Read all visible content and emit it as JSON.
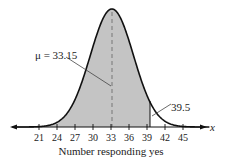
{
  "chart_data": {
    "type": "area",
    "title": "",
    "xlabel": "Number responding yes",
    "ylabel": "",
    "axis_variable": "x",
    "xticks": [
      21,
      24,
      27,
      30,
      33,
      36,
      39,
      42,
      45
    ],
    "xlim": [
      17,
      49
    ],
    "distribution": "normal",
    "mean": 33.15,
    "std_dev_est": 3.6,
    "shaded_region": {
      "from": -999,
      "to": 39.5,
      "color": "#c4c4c4"
    },
    "annotations": [
      {
        "text": "μ = 33.15",
        "x": 33.15,
        "description": "dashed vertical line at mean"
      },
      {
        "text": "39.5",
        "x": 39.5,
        "description": "solid vertical boundary of shaded region"
      }
    ],
    "grid": false
  },
  "labels": {
    "mu": "μ = 33.15",
    "bound": "39.5",
    "xaxis_var": "x",
    "xlabel": "Number responding yes"
  }
}
